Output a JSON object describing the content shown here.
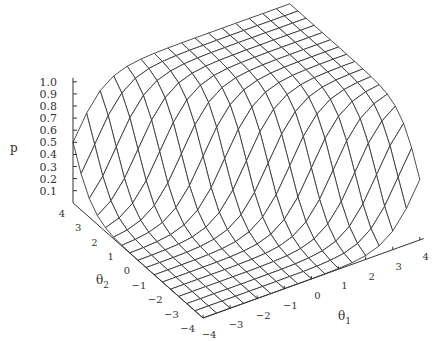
{
  "chart_data": {
    "type": "surface3d",
    "title": "",
    "function": "p = 1 / (1 + exp(-1.7*(theta1 + theta2)))",
    "x": {
      "label": "θ",
      "label_sub": "1",
      "ticks": [
        -4,
        -3,
        -2,
        -1,
        0,
        1,
        2,
        3,
        4
      ],
      "range": [
        -4,
        4
      ]
    },
    "y": {
      "label": "θ",
      "label_sub": "2",
      "ticks": [
        -4,
        -3,
        -2,
        -1,
        0,
        1,
        2,
        3,
        4
      ],
      "range": [
        -4,
        4
      ]
    },
    "z": {
      "label": "p",
      "ticks": [
        "0.1",
        "0.2",
        "0.3",
        "0.4",
        "0.5",
        "0.6",
        "0.7",
        "0.8",
        "0.9",
        "1.0"
      ],
      "range": [
        0,
        1
      ]
    },
    "grid_lines_per_axis": 17,
    "grid": false,
    "legend": null,
    "colors": {
      "mesh": "#3a3a3a",
      "face": "#ffffff",
      "axis": "#333333"
    }
  },
  "labels": {
    "z_axis": "p",
    "x_axis_main": "θ",
    "x_axis_sub": "1",
    "y_axis_main": "θ",
    "y_axis_sub": "2"
  }
}
